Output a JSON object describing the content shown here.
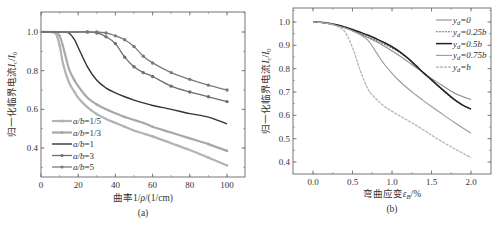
{
  "chart_data": [
    {
      "id": "a",
      "type": "line",
      "panel_label": "(a)",
      "title": "",
      "xlabel": "曲率1/ρ/(1/cm)",
      "ylabel": "归一化临界电流Ic/I0",
      "xlim": [
        0,
        110
      ],
      "ylim": [
        0.35,
        1.1
      ],
      "xticks": [
        0,
        20,
        40,
        60,
        80,
        100
      ],
      "yticks": [
        0.4,
        0.6,
        0.8,
        1.0
      ],
      "ytick_labels": [
        "0.4",
        "0.6",
        "0.8",
        "1.0"
      ],
      "grid": false,
      "legend_position": "lower left",
      "x": [
        0,
        5,
        8,
        10,
        12,
        15,
        18,
        20,
        25,
        30,
        35,
        40,
        45,
        50,
        55,
        60,
        70,
        80,
        90,
        100
      ],
      "series": [
        {
          "name": "a/b=1/5",
          "color": "#b3b3b3",
          "marker": "circle",
          "width": 2.2,
          "values": [
            1.0,
            1.0,
            0.99,
            0.93,
            0.83,
            0.74,
            0.69,
            0.66,
            0.61,
            0.575,
            0.55,
            0.53,
            0.51,
            0.49,
            0.475,
            0.46,
            0.425,
            0.39,
            0.35,
            0.31
          ]
        },
        {
          "name": "a/b=1/3",
          "color": "#a8a8a8",
          "marker": "circle",
          "width": 2.2,
          "values": [
            1.0,
            1.0,
            1.0,
            0.98,
            0.92,
            0.81,
            0.75,
            0.72,
            0.66,
            0.625,
            0.6,
            0.58,
            0.56,
            0.545,
            0.53,
            0.51,
            0.48,
            0.45,
            0.42,
            0.385
          ]
        },
        {
          "name": "a/b=1",
          "color": "#333333",
          "marker": "none",
          "width": 1.4,
          "values": [
            1.0,
            1.0,
            1.0,
            1.0,
            1.0,
            0.995,
            0.96,
            0.92,
            0.82,
            0.75,
            0.71,
            0.685,
            0.665,
            0.648,
            0.633,
            0.62,
            0.6,
            0.578,
            0.56,
            0.525
          ]
        },
        {
          "name": "a/b=3",
          "color": "#6e6e6e",
          "marker": "dot",
          "width": 1.3,
          "values": [
            1.0,
            1.0,
            1.0,
            1.0,
            1.0,
            1.0,
            1.0,
            1.0,
            1.0,
            0.995,
            0.975,
            0.94,
            0.87,
            0.82,
            0.79,
            0.77,
            0.72,
            0.69,
            0.665,
            0.64
          ]
        },
        {
          "name": "a/b=5",
          "color": "#7a7a7a",
          "marker": "dot",
          "width": 1.3,
          "values": [
            1.0,
            1.0,
            1.0,
            1.0,
            1.0,
            1.0,
            1.0,
            1.0,
            1.0,
            1.0,
            0.995,
            0.98,
            0.96,
            0.925,
            0.875,
            0.84,
            0.79,
            0.755,
            0.725,
            0.7
          ]
        }
      ]
    },
    {
      "id": "b",
      "type": "line",
      "panel_label": "(b)",
      "title": "",
      "xlabel": "弯曲应变εB/%",
      "ylabel": "归一化临界电流Ic/I0",
      "xlim": [
        -0.25,
        2.25
      ],
      "ylim": [
        0.35,
        1.05
      ],
      "xticks": [
        0.0,
        0.5,
        1.0,
        1.5,
        2.0
      ],
      "xtick_labels": [
        "0.0",
        "0.5",
        "1.0",
        "1.5",
        "2.0"
      ],
      "yticks": [
        0.4,
        0.5,
        0.6,
        0.7,
        0.8,
        0.9,
        1.0
      ],
      "ytick_labels": [
        "0.4",
        "0.5",
        "0.6",
        "0.7",
        "0.8",
        "0.9",
        "1.0"
      ],
      "grid": false,
      "legend_position": "upper right",
      "x": [
        0.0,
        0.1,
        0.2,
        0.3,
        0.4,
        0.5,
        0.6,
        0.7,
        0.8,
        0.9,
        1.0,
        1.1,
        1.2,
        1.3,
        1.4,
        1.5,
        1.6,
        1.7,
        1.8,
        1.9,
        2.0
      ],
      "series": [
        {
          "name": "yd=0",
          "color": "#8c8c8c",
          "dash": "none",
          "width": 1.1,
          "values": [
            1.0,
            0.998,
            0.993,
            0.985,
            0.975,
            0.962,
            0.948,
            0.933,
            0.916,
            0.897,
            0.876,
            0.854,
            0.83,
            0.806,
            0.782,
            0.758,
            0.736,
            0.714,
            0.694,
            0.68,
            0.668
          ]
        },
        {
          "name": "yd=0.25b",
          "color": "#777777",
          "dash": "2,1",
          "width": 1.1,
          "values": [
            1.0,
            0.998,
            0.993,
            0.985,
            0.975,
            0.963,
            0.95,
            0.936,
            0.921,
            0.905,
            0.888,
            0.868,
            0.843,
            0.812,
            0.78,
            0.75,
            0.72,
            0.69,
            0.663,
            0.642,
            0.625
          ]
        },
        {
          "name": "yd=0.5b",
          "color": "#222222",
          "dash": "none",
          "width": 1.5,
          "values": [
            1.0,
            0.999,
            0.995,
            0.988,
            0.979,
            0.968,
            0.956,
            0.943,
            0.928,
            0.912,
            0.894,
            0.872,
            0.845,
            0.814,
            0.782,
            0.752,
            0.722,
            0.693,
            0.665,
            0.643,
            0.627
          ]
        },
        {
          "name": "yd=0.75b",
          "color": "#9a9a9a",
          "dash": "none",
          "width": 1.1,
          "values": [
            1.0,
            0.998,
            0.993,
            0.985,
            0.975,
            0.962,
            0.945,
            0.92,
            0.87,
            0.82,
            0.78,
            0.745,
            0.715,
            0.688,
            0.662,
            0.638,
            0.614,
            0.59,
            0.567,
            0.545,
            0.523
          ]
        },
        {
          "name": "yd=b",
          "color": "#b0b0b0",
          "dash": "3,1",
          "width": 1.2,
          "values": [
            1.0,
            0.998,
            0.992,
            0.982,
            0.96,
            0.89,
            0.79,
            0.71,
            0.67,
            0.64,
            0.617,
            0.597,
            0.578,
            0.558,
            0.537,
            0.515,
            0.494,
            0.474,
            0.455,
            0.437,
            0.418
          ]
        }
      ]
    }
  ],
  "panels": {
    "a": {
      "panel_label": "(a)",
      "xlabel_prefix": "曲率1/",
      "xlabel_rho": "ρ",
      "xlabel_suffix": "/(1/cm)",
      "ylabel_text": "归一化临界电流",
      "ylabel_sym": "Ic/I0",
      "legend": [
        {
          "prefix": "a/b",
          "suffix": "=1/5"
        },
        {
          "prefix": "a/b",
          "suffix": "=1/3"
        },
        {
          "prefix": "a/b",
          "suffix": "=1"
        },
        {
          "prefix": "a/b",
          "suffix": "=3"
        },
        {
          "prefix": "a/b",
          "suffix": "=5"
        }
      ]
    },
    "b": {
      "panel_label": "(b)",
      "xlabel_prefix": "弯曲应变",
      "xlabel_sym": "εB",
      "xlabel_suffix": "/%",
      "ylabel_text": "归一化临界电流",
      "ylabel_sym": "Ic/I0",
      "legend": [
        {
          "prefix": "yd",
          "suffix": "=0"
        },
        {
          "prefix": "yd",
          "suffix": "=0.25b"
        },
        {
          "prefix": "yd",
          "suffix": "=0.5b"
        },
        {
          "prefix": "yd",
          "suffix": "=0.75b"
        },
        {
          "prefix": "yd",
          "suffix": "=b"
        }
      ]
    }
  }
}
